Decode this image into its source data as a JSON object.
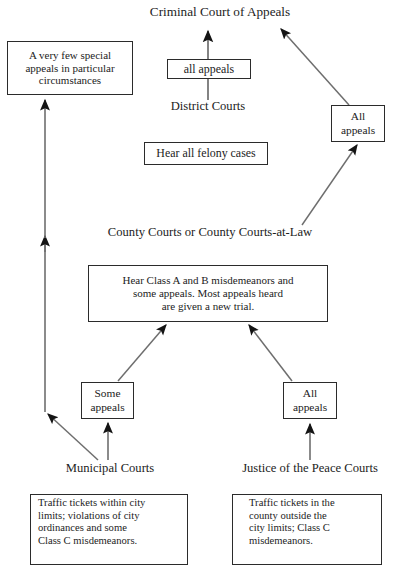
{
  "diagram": {
    "background_color": "#ffffff",
    "line_color": "#4a4a4a",
    "arrow_color": "#1a1a1a",
    "box_border_color": "#2b2b2b",
    "text_color": "#1c1c1c"
  },
  "nodes": {
    "criminal_court_of_appeals": {
      "label": "Criminal Court of Appeals",
      "type": "court-label"
    },
    "special_appeals_box": {
      "label": "A very few special appeals in particular circumstances",
      "line1": "A very few special",
      "line2": "appeals in particular",
      "line3": "circumstances",
      "type": "annotation-box"
    },
    "all_appeals_district": {
      "label": "all appeals",
      "type": "edge-label-box"
    },
    "district_courts": {
      "label": "District Courts",
      "type": "court-label"
    },
    "felony_cases_box": {
      "label": "Hear all felony cases",
      "type": "annotation-box"
    },
    "all_appeals_county": {
      "label": "All appeals",
      "line1": "All",
      "line2": "appeals",
      "type": "edge-label-box"
    },
    "county_courts": {
      "label": "County Courts or County Courts-at-Law",
      "type": "court-label"
    },
    "misdemeanors_box": {
      "label": "Hear Class A and B misdemeanors and some appeals. Most appeals heard are given a new trial.",
      "line1": "Hear Class A and B misdemeanors and",
      "line2": "some appeals. Most appeals heard",
      "line3": "are given a new trial.",
      "type": "annotation-box"
    },
    "some_appeals_municipal": {
      "label": "Some appeals",
      "line1": "Some",
      "line2": "appeals",
      "type": "edge-label-box"
    },
    "all_appeals_jp": {
      "label": "All appeals",
      "line1": "All",
      "line2": "appeals",
      "type": "edge-label-box"
    },
    "municipal_courts": {
      "label": "Municipal Courts",
      "type": "court-label"
    },
    "justice_of_the_peace_courts": {
      "label": "Justice of the Peace Courts",
      "type": "court-label"
    },
    "municipal_jurisdiction_box": {
      "label": "Traffic tickets within city limits; violations of city ordinances and some Class C misdemeanors.",
      "line1": "Traffic tickets within city",
      "line2": "limits; violations of city",
      "line3": "ordinances and some",
      "line4": "Class C misdemeanors.",
      "type": "annotation-box"
    },
    "jp_jurisdiction_box": {
      "label": "Traffic tickets in the county outside the city limits; Class C misdemeanors.",
      "line1": "Traffic tickets in the",
      "line2": "county outside the",
      "line3": "city limits; Class C",
      "line4": "misdemeanors.",
      "type": "annotation-box"
    }
  },
  "edges": [
    {
      "name": "district-to-criminal-court",
      "from": "district_courts",
      "to": "criminal_court_of_appeals",
      "label": "all appeals"
    },
    {
      "name": "county-allappeals-to-criminal-court",
      "from": "all_appeals_county",
      "to": "criminal_court_of_appeals",
      "label": "All appeals"
    },
    {
      "name": "county-to-allappeals",
      "from": "county_courts",
      "to": "all_appeals_county",
      "label": "All appeals"
    },
    {
      "name": "municipal-to-special-appeals",
      "from": "municipal_courts",
      "to": "special_appeals_box",
      "label": "A very few special appeals in particular circumstances"
    },
    {
      "name": "municipal-to-some-appeals",
      "from": "municipal_courts",
      "to": "some_appeals_municipal",
      "label": "Some appeals"
    },
    {
      "name": "some-appeals-to-county",
      "from": "some_appeals_municipal",
      "to": "county_courts",
      "label": "Some appeals"
    },
    {
      "name": "jp-to-all-appeals",
      "from": "justice_of_the_peace_courts",
      "to": "all_appeals_jp",
      "label": "All appeals"
    },
    {
      "name": "jp-allappeals-to-county",
      "from": "all_appeals_jp",
      "to": "county_courts",
      "label": "All appeals"
    }
  ]
}
